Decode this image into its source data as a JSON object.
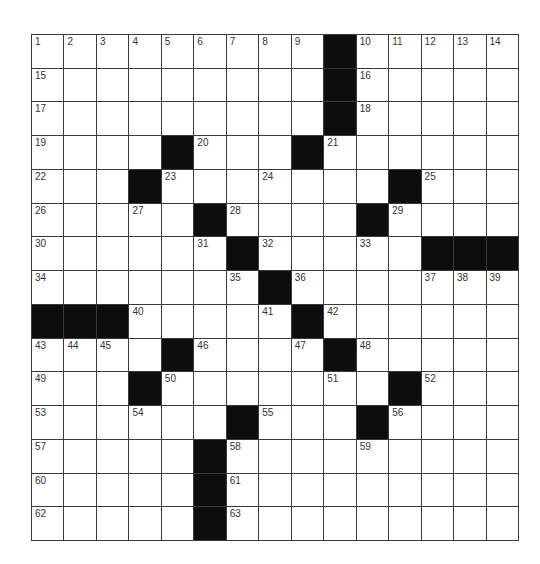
{
  "puzzle": {
    "rows": 15,
    "cols": 15,
    "colors": {
      "block": "#0d0d0d",
      "cell": "#ffffff",
      "line": "#3a3a3a",
      "number": "#333333"
    },
    "layout": [
      "1.2.3.4.5.6.7.8.9.#.10.11.12.13.14",
      "15._._._._._._._._.#.16._._._._",
      "17._._._._._._._._.#.18._._._._",
      "19._._._.#.20._._.#.21._._._._._",
      "22._._.#.23._._.24._._._.#.25._._",
      "26._._.27._.#.28._._._.#.29._._._",
      "30._._._._.31.#.32._._.33._.#.#.#",
      "34._._._._._.35.#.36._._._.37.38.39",
      "#.#.#.40._._._.41.#.42._._._._._",
      "43.44.45._.#.46._._.47.#.48._._._._",
      "49._._.#.50._._._._.51._.#.52._._",
      "53._._.54._._.#.55._._.#.56._._._",
      "57._._._._.#.58._._._.59._._._._",
      "60._._._._.#.61._._._._._._._._",
      "62._._._._.#.63._._._._._._._._"
    ]
  }
}
